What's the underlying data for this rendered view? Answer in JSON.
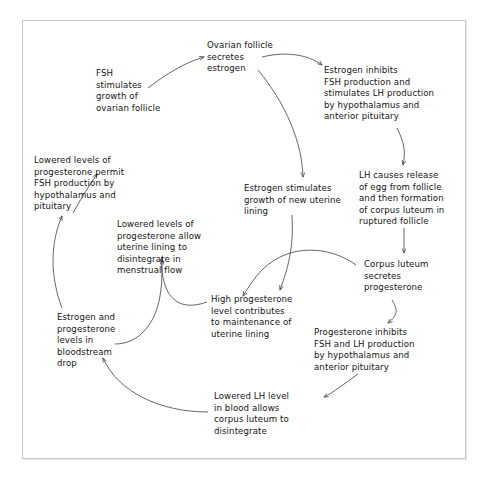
{
  "diagram": {
    "background_color": "#ffffff",
    "frame_border_color": "#c9c9c9",
    "text_color": "#141414",
    "arrow_color": "#4a4a4a",
    "nodes": [
      {
        "id": "ovarian_follicle",
        "text": "Ovarian follicle\nsecretes\nestrogen"
      },
      {
        "id": "fsh_stimulates",
        "text": "FSH\nstimulates\ngrowth of\novarian follicle"
      },
      {
        "id": "estrogen_inhibits",
        "text": "Estrogen inhibits\nFSH production and\nstimulates LH production\nby hypothalamus and\nanterior pituitary"
      },
      {
        "id": "lowered_progesterone_permit",
        "text": "Lowered levels of\nprogesterone permit\nFSH production by\nhypothalamus and\npituitary"
      },
      {
        "id": "estrogen_stimulates_uterine",
        "text": "Estrogen stimulates\ngrowth of new uterine\nlining"
      },
      {
        "id": "lh_causes_release",
        "text": "LH causes release\nof egg from follicle\nand then formation\nof corpus luteum in\nruptured follicle"
      },
      {
        "id": "lowered_progesterone_allow",
        "text": "Lowered levels of\nprogesterone allow\nuterine lining to\ndisintegrate in\nmenstrual flow"
      },
      {
        "id": "corpus_luteum_secretes",
        "text": "Corpus luteum\nsecretes\nprogesterone"
      },
      {
        "id": "high_progesterone",
        "text": "High progesterone\nlevel contributes\nto maintenance of\nuterine lining"
      },
      {
        "id": "progesterone_inhibits",
        "text": "Progesterone inhibits\nFSH and LH production\nby hypothalamus and\nanterior pituitary"
      },
      {
        "id": "estrogen_progesterone_drop",
        "text": "Estrogen and\nprogesterone\nlevels in\nbloodstream\ndrop"
      },
      {
        "id": "lowered_lh_level",
        "text": "Lowered LH level\nin blood allows\ncorpus luteum to\ndisintegrate"
      }
    ],
    "edges": [
      {
        "from": "fsh_stimulates",
        "to": "ovarian_follicle"
      },
      {
        "from": "ovarian_follicle",
        "to": "estrogen_inhibits"
      },
      {
        "from": "ovarian_follicle",
        "to": "estrogen_stimulates_uterine"
      },
      {
        "from": "estrogen_inhibits",
        "to": "lh_causes_release"
      },
      {
        "from": "lh_causes_release",
        "to": "corpus_luteum_secretes"
      },
      {
        "from": "corpus_luteum_secretes",
        "to": "progesterone_inhibits"
      },
      {
        "from": "corpus_luteum_secretes",
        "to": "high_progesterone"
      },
      {
        "from": "estrogen_stimulates_uterine",
        "to": "high_progesterone"
      },
      {
        "from": "progesterone_inhibits",
        "to": "lowered_lh_level"
      },
      {
        "from": "lowered_lh_level",
        "to": "estrogen_progesterone_drop"
      },
      {
        "from": "estrogen_progesterone_drop",
        "to": "lowered_progesterone_permit"
      },
      {
        "from": "high_progesterone",
        "to": "lowered_progesterone_allow"
      },
      {
        "from": "estrogen_progesterone_drop",
        "to": "lowered_progesterone_allow"
      },
      {
        "from": "lowered_progesterone_permit",
        "to": "fsh_stimulates"
      }
    ]
  }
}
